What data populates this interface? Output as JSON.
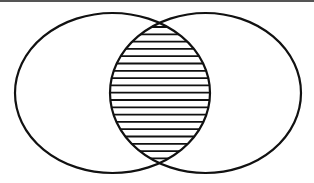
{
  "diagram": {
    "type": "venn",
    "sets": [
      {
        "name": "set-a",
        "cx": 112.5,
        "cy": 93,
        "rx": 97.5,
        "ry": 80
      },
      {
        "name": "set-b",
        "cx": 205.5,
        "cy": 93,
        "rx": 95.5,
        "ry": 80
      }
    ],
    "highlighted_region": "intersection",
    "fill_style": "horizontal-hatch",
    "hatch_spacing": 7.3,
    "hatch_start_y": 27,
    "stroke_color": "#111111",
    "background_color": "#ffffff",
    "top_rule_color": "#555555"
  }
}
